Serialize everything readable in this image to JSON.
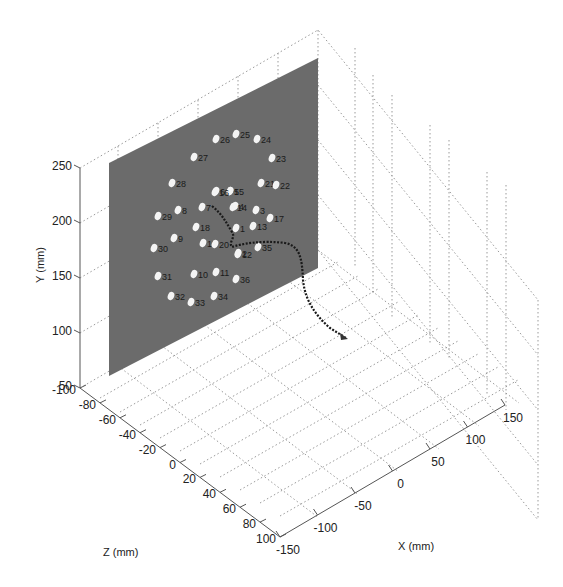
{
  "chart_data": {
    "type": "scatter3d",
    "title": "",
    "xlabel": "X (mm)",
    "ylabel": "Y (mm)",
    "zlabel": "Z (mm)",
    "x_ticks": [
      "-150",
      "-100",
      "-50",
      "0",
      "50",
      "100",
      "150"
    ],
    "y_ticks": [
      "50",
      "100",
      "150",
      "200",
      "250"
    ],
    "z_ticks": [
      "-100",
      "-80",
      "-60",
      "-40",
      "-20",
      "0",
      "20",
      "40",
      "60",
      "80",
      "100"
    ],
    "xlim": [
      -150,
      150
    ],
    "ylim": [
      50,
      250
    ],
    "zlim": [
      -100,
      100
    ],
    "grid": true,
    "plane": {
      "color": "#6b6b6b",
      "description": "target plane with numbered marker points"
    },
    "trajectory": {
      "color": "#1a1a1a",
      "style": "dotted-line",
      "description": "path approaching plane, ending near marker 1"
    },
    "markers": [
      {
        "label": "1",
        "px": 236,
        "py": 228
      },
      {
        "label": "2",
        "px": 238,
        "py": 253
      },
      {
        "label": "3",
        "px": 256,
        "py": 210
      },
      {
        "label": "4",
        "px": 235,
        "py": 206
      },
      {
        "label": "5",
        "px": 230,
        "py": 191
      },
      {
        "label": "6",
        "px": 216,
        "py": 191
      },
      {
        "label": "7",
        "px": 202,
        "py": 207
      },
      {
        "label": "8",
        "px": 178,
        "py": 210
      },
      {
        "label": "9",
        "px": 174,
        "py": 238
      },
      {
        "label": "10",
        "px": 194,
        "py": 274
      },
      {
        "label": "11",
        "px": 216,
        "py": 272
      },
      {
        "label": "12",
        "px": 238,
        "py": 254
      },
      {
        "label": "13",
        "px": 253,
        "py": 226
      },
      {
        "label": "14",
        "px": 233,
        "py": 207
      },
      {
        "label": "15",
        "px": 230,
        "py": 191
      },
      {
        "label": "16",
        "px": 215,
        "py": 192
      },
      {
        "label": "17",
        "px": 270,
        "py": 218
      },
      {
        "label": "18",
        "px": 196,
        "py": 227
      },
      {
        "label": "19",
        "px": 203,
        "py": 243
      },
      {
        "label": "20",
        "px": 215,
        "py": 244
      },
      {
        "label": "21",
        "px": 261,
        "py": 183
      },
      {
        "label": "22",
        "px": 276,
        "py": 185
      },
      {
        "label": "23",
        "px": 272,
        "py": 158
      },
      {
        "label": "24",
        "px": 257,
        "py": 139
      },
      {
        "label": "25",
        "px": 236,
        "py": 134
      },
      {
        "label": "26",
        "px": 216,
        "py": 139
      },
      {
        "label": "27",
        "px": 194,
        "py": 157
      },
      {
        "label": "28",
        "px": 172,
        "py": 183
      },
      {
        "label": "29",
        "px": 158,
        "py": 216
      },
      {
        "label": "30",
        "px": 154,
        "py": 248
      },
      {
        "label": "31",
        "px": 158,
        "py": 276
      },
      {
        "label": "32",
        "px": 171,
        "py": 296
      },
      {
        "label": "33",
        "px": 191,
        "py": 302
      },
      {
        "label": "34",
        "px": 214,
        "py": 296
      },
      {
        "label": "35",
        "px": 258,
        "py": 247
      },
      {
        "label": "36",
        "px": 236,
        "py": 279
      }
    ]
  }
}
